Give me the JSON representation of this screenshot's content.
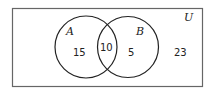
{
  "diagram": {
    "type": "venn",
    "universe_label": "U",
    "sets": [
      {
        "label": "A",
        "only_count": "15"
      },
      {
        "label": "B",
        "only_count": "5"
      }
    ],
    "intersection_count": "10",
    "outside_count": "23"
  }
}
